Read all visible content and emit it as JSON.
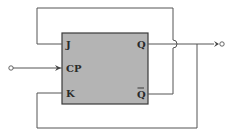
{
  "diagram": {
    "type": "JK flip-flop with feedback",
    "block": {
      "fill": "#b4b4b4",
      "border": "#3a3a3a",
      "inputs": {
        "j": "J",
        "cp": "CP",
        "k": "K"
      },
      "outputs": {
        "q": "Q",
        "qbar": "Q"
      }
    },
    "connections": [
      "Q-bar feeds back to J (top loop)",
      "Q feeds back to K (bottom loop)",
      "Q to output terminal",
      "external clock to CP"
    ],
    "line_color": "#555555"
  }
}
